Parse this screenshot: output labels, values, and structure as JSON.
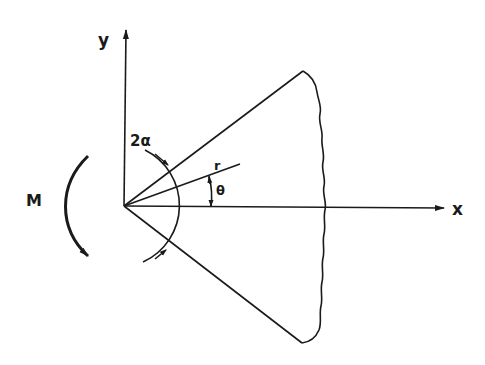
{
  "diagram": {
    "type": "wedge-moment",
    "labels": {
      "y_axis": "y",
      "x_axis": "x",
      "moment": "M",
      "wedge_angle": "2α",
      "radius": "r",
      "angle": "θ"
    },
    "colors": {
      "ink": "#1a1a1a",
      "background": "#ffffff"
    }
  }
}
